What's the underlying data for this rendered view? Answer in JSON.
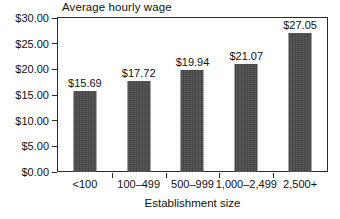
{
  "chart_data": {
    "type": "bar",
    "title": "Average hourly wage",
    "xlabel": "Establishment size",
    "ylabel": "",
    "categories": [
      "<100",
      "100–499",
      "500–999",
      "1,000–2,499",
      "2,500+"
    ],
    "values": [
      15.69,
      17.72,
      19.94,
      21.07,
      27.05
    ],
    "value_labels": [
      "$15.69",
      "$17.72",
      "$19.94",
      "$21.07",
      "$27.05"
    ],
    "ylim": [
      0,
      30
    ],
    "ytick_values": [
      0,
      5,
      10,
      15,
      20,
      25,
      30
    ],
    "ytick_labels": [
      "$0.00",
      "$5.00",
      "$10.00",
      "$15.00",
      "$20.00",
      "$25.00",
      "$30.00"
    ],
    "grid": false,
    "legend": false,
    "legend_position": "none",
    "bar_color": "#474747",
    "axis_color": "#2b2b2b",
    "background_color": "#ffffff"
  }
}
